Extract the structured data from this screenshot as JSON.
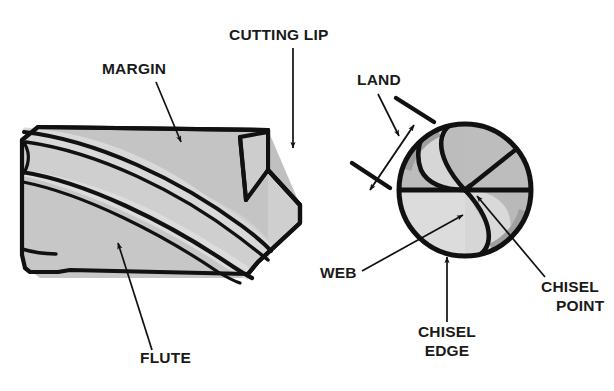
{
  "figure": {
    "background_color": "#ffffff",
    "line_color": "#111111",
    "label_color": "#1a1a1a"
  },
  "palette": {
    "body_light": "#d4d4d4",
    "body_mid": "#c2c2c2",
    "body_dark": "#b0b0b0",
    "end_light": "#d8d8d8",
    "end_mid": "#c9c9c9",
    "end_dark": "#b2b2b2",
    "outline": "#111111",
    "white": "#ffffff"
  },
  "views": {
    "side_view": {
      "name": "side-view-drill-body",
      "description": "Side view of twist drill body with helical flutes and chamfered point"
    },
    "end_view": {
      "name": "end-view-drill-point",
      "description": "End view of drill point showing web, chisel edge, chisel point and land"
    }
  },
  "labels": [
    {
      "id": "margin",
      "text": "MARGIN",
      "x": 102,
      "y": 74,
      "anchor": "start",
      "lines": [
        "MARGIN"
      ]
    },
    {
      "id": "cutting-lip",
      "text": "CUTTING LIP",
      "x": 229,
      "y": 40,
      "anchor": "start",
      "lines": [
        "CUTTING LIP"
      ]
    },
    {
      "id": "flute",
      "text": "FLUTE",
      "x": 140,
      "y": 363,
      "anchor": "start",
      "lines": [
        "FLUTE"
      ]
    },
    {
      "id": "land",
      "text": "LAND",
      "x": 357,
      "y": 85,
      "anchor": "start",
      "lines": [
        "LAND"
      ]
    },
    {
      "id": "web",
      "text": "WEB",
      "x": 320,
      "y": 278,
      "anchor": "start",
      "lines": [
        "WEB"
      ]
    },
    {
      "id": "chisel-point",
      "text": "CHISEL POINT",
      "x": 541,
      "y": 292,
      "anchor": "start",
      "lines": [
        "CHISEL",
        "POINT"
      ]
    },
    {
      "id": "chisel-edge",
      "text": "CHISEL EDGE",
      "x": 447,
      "y": 337,
      "anchor": "middle",
      "lines": [
        "CHISEL",
        "EDGE"
      ]
    }
  ],
  "label_text": {
    "margin": "MARGIN",
    "cutting_lip": "CUTTING LIP",
    "flute": "FLUTE",
    "land": "LAND",
    "web": "WEB",
    "chisel_point_line1": "CHISEL",
    "chisel_point_line2": "POINT",
    "chisel_edge_line1": "CHISEL",
    "chisel_edge_line2": "EDGE"
  }
}
